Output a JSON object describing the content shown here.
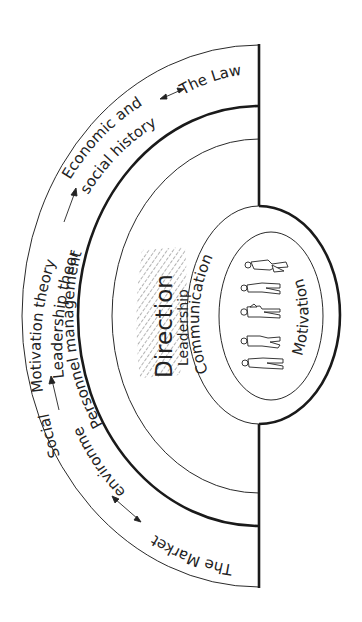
{
  "diagram": {
    "title": "",
    "colors": {
      "ink": "#1a1a1a",
      "background": "#ffffff",
      "hatch": "#444444"
    },
    "outer_ring": {
      "labels": {
        "the_law": "The Law",
        "economic_line1": "Economic and",
        "economic_line2": "social history",
        "motivation_theory": "Motivation theory",
        "leadership_theory": "Leadership theory",
        "social": "Social",
        "environment": "environment",
        "the_market": "The Market"
      }
    },
    "middle_ring": {
      "label": "Personnel  management"
    },
    "inner_band": {
      "direction": "Direction",
      "leadership": "Leadership"
    },
    "outer_oval": {
      "label": "Communication"
    },
    "inner_oval": {
      "label": "Motivation",
      "figures": [
        "person-1",
        "person-2",
        "person-3",
        "person-4",
        "person-5"
      ]
    }
  }
}
